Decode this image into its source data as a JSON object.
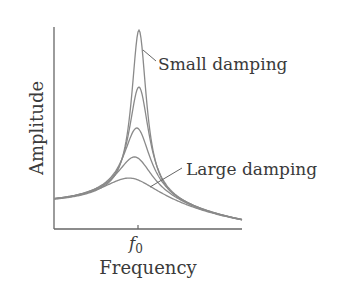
{
  "chart_data": {
    "type": "line",
    "title": "",
    "xlabel": "Frequency",
    "ylabel": "Amplitude",
    "x_ticks": [
      {
        "label": "f0",
        "sub": "0",
        "base": "f",
        "x": 138
      }
    ],
    "grid": false,
    "legend": "none",
    "annotations": [
      {
        "text": "Small damping",
        "points_to": "highest-peak curve"
      },
      {
        "text": "Large damping",
        "points_to": "lowest-peak curve"
      }
    ],
    "series": [
      {
        "name": "Small damping",
        "peak_relative_amplitude": 1.0
      },
      {
        "name": "Medium-small damping",
        "peak_relative_amplitude": 0.67
      },
      {
        "name": "Medium damping",
        "peak_relative_amplitude": 0.43
      },
      {
        "name": "Medium-large damping",
        "peak_relative_amplitude": 0.25
      },
      {
        "name": "Large damping",
        "peak_relative_amplitude": 0.13
      }
    ],
    "curves_px": [
      {
        "peak_x": 139,
        "peak_y": 30,
        "width": 9
      },
      {
        "peak_x": 139,
        "peak_y": 87,
        "width": 12
      },
      {
        "peak_x": 137,
        "peak_y": 128,
        "width": 16
      },
      {
        "peak_x": 135,
        "peak_y": 157,
        "width": 21
      },
      {
        "peak_x": 130,
        "peak_y": 178,
        "width": 30
      }
    ]
  },
  "labels": {
    "ylabel": "Amplitude",
    "xlabel": "Frequency",
    "tick_base": "f",
    "tick_sub": "0",
    "small": "Small damping",
    "large": "Large damping"
  },
  "colors": {
    "curve": "#8a8a8a",
    "axis": "#555555",
    "text": "#3a3a3a"
  }
}
